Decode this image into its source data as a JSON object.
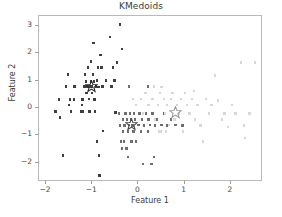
{
  "chart_data": {
    "type": "scatter",
    "title": "KMedoids",
    "xlabel": "Feature 1",
    "ylabel": "Feature 2",
    "xlim": [
      -2.15,
      2.65
    ],
    "ylim": [
      -2.62,
      3.35
    ],
    "xticks": [
      -2,
      -1,
      0,
      1,
      2
    ],
    "xticklabels": [
      "−2",
      "−1",
      "0",
      "1",
      "2"
    ],
    "yticks": [
      -2,
      -1,
      0,
      1,
      2,
      3
    ],
    "yticklabels": [
      "−2",
      "−1",
      "0",
      "1",
      "2",
      "3"
    ],
    "grid": false,
    "legend": null,
    "marker": "square",
    "marker_size": 2.4,
    "centroid_marker": "star",
    "colors": {
      "cluster_0": "#3f3f3f",
      "cluster_1": "#6e6e6e",
      "cluster_2": "#d8d8d8",
      "centroid_0": "#2b2b2b",
      "centroid_1": "#4a4a4a",
      "centroid_2": "#9a9a9a",
      "axes": "#b9b9b9",
      "text": "#3b3b3b",
      "background": "#ffffff"
    },
    "series": [
      {
        "name": "cluster_0",
        "color": "#3f3f3f",
        "points": [
          [
            -1.79,
            -0.12
          ],
          [
            -1.72,
            0.31
          ],
          [
            -1.7,
            -0.34
          ],
          [
            -1.63,
            -1.73
          ],
          [
            -1.57,
            0.79
          ],
          [
            -1.52,
            1.22
          ],
          [
            -1.5,
            0.1
          ],
          [
            -1.48,
            0.31
          ],
          [
            -1.46,
            -0.13
          ],
          [
            -1.4,
            0.31
          ],
          [
            -1.38,
            0.78
          ],
          [
            -1.24,
            -0.12
          ],
          [
            -1.22,
            0.1
          ],
          [
            -1.21,
            0.31
          ],
          [
            -1.2,
            -0.13
          ],
          [
            -1.18,
            0.78
          ],
          [
            -1.16,
            1.22
          ],
          [
            -1.13,
            0.97
          ],
          [
            -1.12,
            0.55
          ],
          [
            -1.1,
            0.78
          ],
          [
            -1.09,
            1.47
          ],
          [
            -1.07,
            0.32
          ],
          [
            -1.06,
            -0.12
          ],
          [
            -1.04,
            0.78
          ],
          [
            -1.03,
            0.97
          ],
          [
            -1.02,
            1.7
          ],
          [
            -1.01,
            0.55
          ],
          [
            -1.0,
            0.78
          ],
          [
            -0.98,
            1.22
          ],
          [
            -0.97,
            2.36
          ],
          [
            -0.96,
            0.97
          ],
          [
            -0.95,
            0.31
          ],
          [
            -0.94,
            -0.13
          ],
          [
            -0.92,
            0.78
          ],
          [
            -0.9,
            1.0
          ],
          [
            -0.89,
            -1.22
          ],
          [
            -0.88,
            1.47
          ],
          [
            -0.86,
            0.77
          ],
          [
            -0.85,
            -1.73
          ],
          [
            -0.84,
            -2.46
          ],
          [
            -0.82,
            1.93
          ],
          [
            -0.8,
            1.47
          ],
          [
            -0.78,
            0.78
          ],
          [
            -0.76,
            -0.84
          ],
          [
            -0.7,
            1.0
          ],
          [
            -0.62,
            2.58
          ],
          [
            -0.58,
            0.78
          ],
          [
            -0.55,
            1.47
          ],
          [
            -0.52,
            1.0
          ],
          [
            -0.5,
            -0.16
          ],
          [
            -0.46,
            1.66
          ],
          [
            -0.4,
            3.04
          ],
          [
            -0.36,
            2.14
          ],
          [
            -1.17,
            0.78
          ]
        ]
      },
      {
        "name": "cluster_1",
        "color": "#6e6e6e",
        "points": [
          [
            -0.42,
            -0.2
          ],
          [
            -0.4,
            -0.63
          ],
          [
            -0.38,
            -1.22
          ],
          [
            -0.36,
            -1.48
          ],
          [
            -0.34,
            -0.42
          ],
          [
            -0.33,
            -0.86
          ],
          [
            -0.31,
            -1.22
          ],
          [
            -0.3,
            -0.63
          ],
          [
            -0.28,
            -0.2
          ],
          [
            -0.26,
            -1.48
          ],
          [
            -0.25,
            -0.42
          ],
          [
            -0.23,
            -1.78
          ],
          [
            -0.22,
            -0.86
          ],
          [
            -0.2,
            -0.62
          ],
          [
            -0.18,
            -0.2
          ],
          [
            -0.16,
            -0.42
          ],
          [
            -0.15,
            -1.22
          ],
          [
            -0.13,
            -0.63
          ],
          [
            -0.11,
            -0.86
          ],
          [
            -0.09,
            -0.2
          ],
          [
            -0.07,
            -0.42
          ],
          [
            -0.05,
            -1.22
          ],
          [
            0.0,
            -0.62
          ],
          [
            0.02,
            -0.2
          ],
          [
            0.05,
            -0.86
          ],
          [
            0.08,
            -0.42
          ],
          [
            0.1,
            -2.04
          ],
          [
            0.12,
            -0.63
          ],
          [
            0.16,
            -0.2
          ],
          [
            0.2,
            -0.86
          ],
          [
            0.22,
            -0.42
          ],
          [
            0.25,
            -0.62
          ],
          [
            0.28,
            -2.04
          ],
          [
            0.3,
            -0.2
          ],
          [
            0.33,
            -1.78
          ],
          [
            0.36,
            -0.63
          ],
          [
            0.4,
            -0.42
          ],
          [
            0.44,
            -0.86
          ],
          [
            0.5,
            -0.62
          ],
          [
            0.55,
            -0.2
          ],
          [
            0.62,
            -0.63
          ],
          [
            0.7,
            -0.42
          ],
          [
            0.8,
            -0.62
          ],
          [
            0.95,
            -0.63
          ],
          [
            -0.2,
            0.78
          ],
          [
            0.2,
            0.78
          ]
        ]
      },
      {
        "name": "cluster_2",
        "color": "#d8d8d8",
        "points": [
          [
            -0.12,
            0.32
          ],
          [
            -0.05,
            0.1
          ],
          [
            0.05,
            0.32
          ],
          [
            0.1,
            -0.2
          ],
          [
            0.15,
            0.54
          ],
          [
            0.22,
            0.1
          ],
          [
            0.3,
            0.32
          ],
          [
            0.33,
            0.78
          ],
          [
            0.36,
            -0.42
          ],
          [
            0.42,
            0.1
          ],
          [
            0.46,
            0.54
          ],
          [
            0.48,
            -0.86
          ],
          [
            0.5,
            0.77
          ],
          [
            0.55,
            0.32
          ],
          [
            0.58,
            -0.2
          ],
          [
            0.62,
            0.1
          ],
          [
            0.66,
            -0.62
          ],
          [
            0.7,
            0.32
          ],
          [
            0.74,
            0.54
          ],
          [
            0.78,
            -0.42
          ],
          [
            0.84,
            0.1
          ],
          [
            0.88,
            -0.2
          ],
          [
            0.92,
            0.32
          ],
          [
            0.96,
            -0.86
          ],
          [
            1.0,
            0.54
          ],
          [
            1.05,
            0.1
          ],
          [
            1.1,
            -0.2
          ],
          [
            1.16,
            0.32
          ],
          [
            1.22,
            -0.42
          ],
          [
            1.28,
            0.1
          ],
          [
            1.34,
            -0.63
          ],
          [
            1.4,
            -1.22
          ],
          [
            1.46,
            0.32
          ],
          [
            1.52,
            -0.2
          ],
          [
            1.58,
            0.1
          ],
          [
            1.66,
            1.18
          ],
          [
            1.72,
            0.28
          ],
          [
            1.8,
            -0.42
          ],
          [
            1.86,
            -0.2
          ],
          [
            1.94,
            -0.7
          ],
          [
            2.02,
            0.1
          ],
          [
            2.1,
            -0.2
          ],
          [
            2.22,
            1.66
          ],
          [
            2.28,
            -0.63
          ],
          [
            2.3,
            -1.08
          ],
          [
            2.4,
            -0.2
          ],
          [
            2.52,
            1.66
          ],
          [
            1.2,
            0.62
          ],
          [
            0.44,
            -0.86
          ],
          [
            0.6,
            -0.86
          ]
        ]
      }
    ],
    "centroids": [
      {
        "name": "centroid_0",
        "x": -1.02,
        "y": 0.78,
        "color": "#2b2b2b"
      },
      {
        "name": "centroid_1",
        "x": -0.16,
        "y": -0.61,
        "color": "#4a4a4a"
      },
      {
        "name": "centroid_2",
        "x": 0.8,
        "y": -0.18,
        "color": "#9a9a9a"
      }
    ]
  }
}
